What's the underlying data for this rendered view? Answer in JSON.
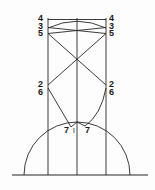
{
  "diagram": {
    "type": "line-diagram",
    "stroke_color": "#262626",
    "background_color": "#fdfdfd",
    "labels": {
      "left_top_4": "4",
      "left_top_3": "3",
      "left_top_5": "5",
      "left_mid_2": "2",
      "left_mid_6": "6",
      "right_top_4": "4",
      "right_top_3": "3",
      "right_top_5": "5",
      "right_mid_2": "2",
      "right_mid_6": "6",
      "bottom_left_7": "7",
      "bottom_center_tick": "l",
      "bottom_right_7": "7"
    },
    "geometry": {
      "baseline_y": 175,
      "baseline_x_start": 12,
      "baseline_x_end": 148,
      "vertical_left_x": 48,
      "vertical_center_x": 77,
      "vertical_right_x": 106,
      "vertical_top_y": 18,
      "semicircle_center_x": 77,
      "semicircle_radius": 53,
      "semicircle_apex_y": 122,
      "level_4_y": 19,
      "level_3_y": 27,
      "level_5_y": 33,
      "level_2_y": 85,
      "level_6_y": 93,
      "level_7_y": 125
    }
  }
}
